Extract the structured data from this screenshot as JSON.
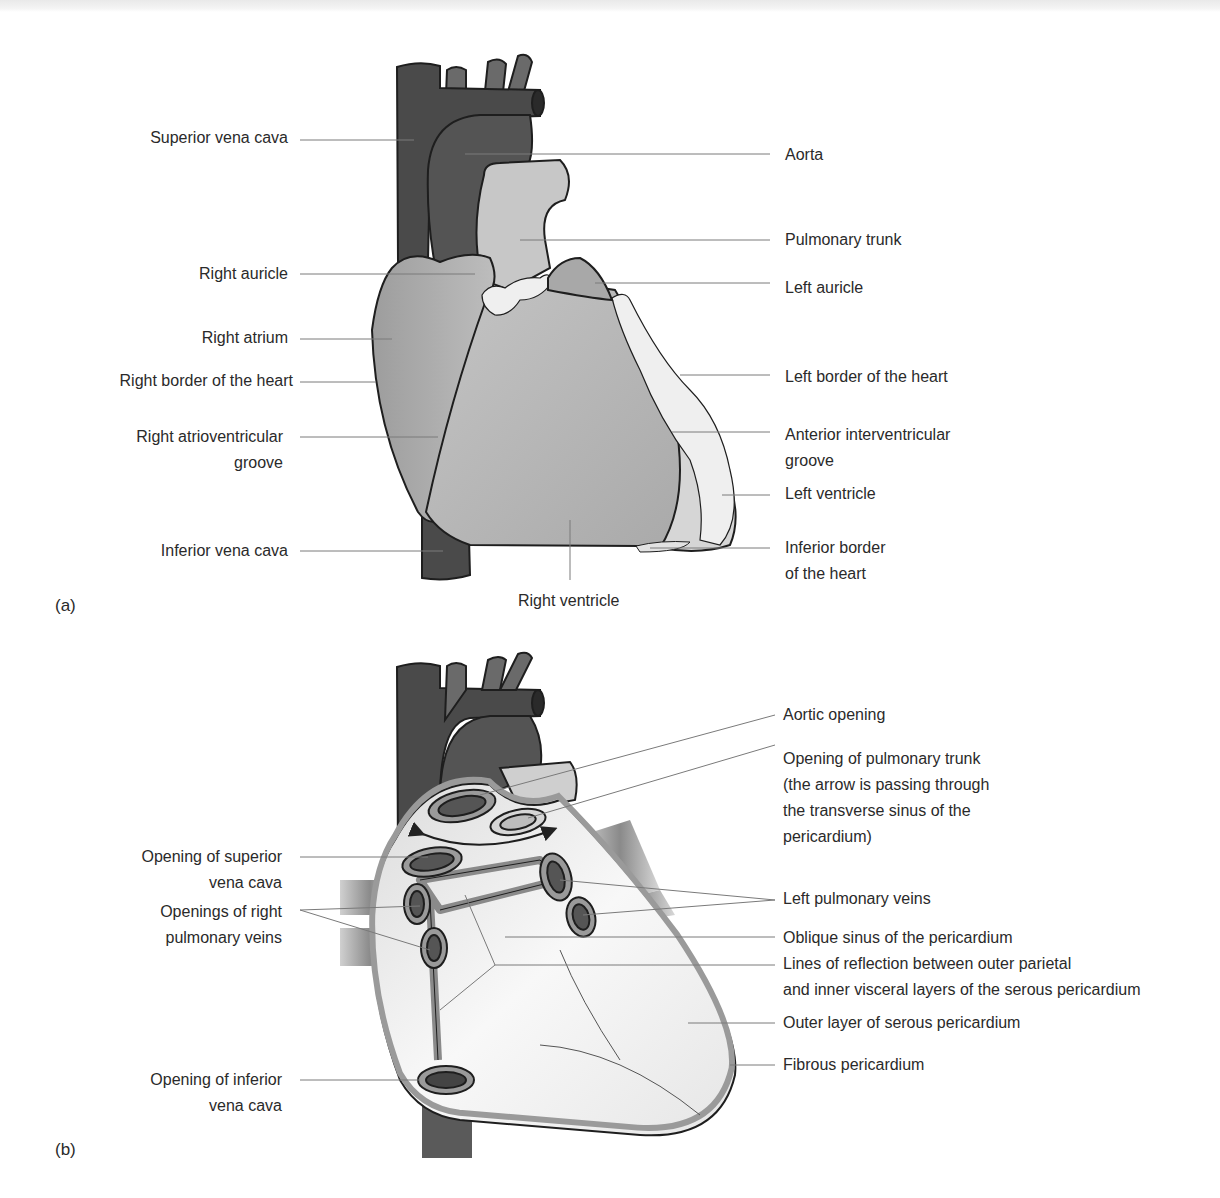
{
  "figure": {
    "panel_a": {
      "tag": "(a)",
      "labels_left": {
        "superior_vena_cava": "Superior vena cava",
        "right_auricle": "Right auricle",
        "right_atrium": "Right atrium",
        "right_border": "Right border of the heart",
        "right_av_groove_1": "Right atrioventricular",
        "right_av_groove_2": "groove",
        "inferior_vena_cava": "Inferior vena cava"
      },
      "labels_right": {
        "aorta": "Aorta",
        "pulmonary_trunk": "Pulmonary trunk",
        "left_auricle": "Left auricle",
        "left_border": "Left border of the heart",
        "anterior_iv_groove_1": "Anterior interventricular",
        "anterior_iv_groove_2": "groove",
        "left_ventricle": "Left ventricle",
        "inferior_border_1": "Inferior border",
        "inferior_border_2": "of the heart"
      },
      "labels_bottom": {
        "right_ventricle": "Right ventricle"
      }
    },
    "panel_b": {
      "tag": "(b)",
      "labels_left": {
        "svc_opening_1": "Opening of superior",
        "svc_opening_2": "vena cava",
        "right_pv_1": "Openings of right",
        "right_pv_2": "pulmonary veins",
        "ivc_opening_1": "Opening of inferior",
        "ivc_opening_2": "vena cava"
      },
      "labels_right": {
        "aortic_opening": "Aortic opening",
        "pulm_trunk_opening_1": "Opening of pulmonary trunk",
        "pulm_trunk_opening_2": "(the arrow is passing through",
        "pulm_trunk_opening_3": "the transverse sinus of the",
        "pulm_trunk_opening_4": "pericardium)",
        "left_pv": "Left pulmonary veins",
        "oblique_sinus": "Oblique sinus of the pericardium",
        "reflection_1": "Lines of reflection between outer parietal",
        "reflection_2": "and inner visceral layers of the serous pericardium",
        "outer_serous": "Outer layer of serous pericardium",
        "fibrous": "Fibrous pericardium"
      }
    },
    "colors": {
      "vessel_dark": "#4a4a4a",
      "vessel_mid": "#6e6e6e",
      "chamber": "#b8b8b8",
      "chamber_light": "#cfcfcf",
      "fat": "#ececec",
      "pericardium_fill": "#f0f0f0",
      "pericardium_rim": "#9a9a9a",
      "leader_line": "#7a7a7a"
    }
  }
}
